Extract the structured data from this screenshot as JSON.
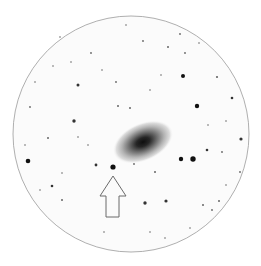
{
  "image": {
    "width": 261,
    "height": 266,
    "background": "#ffffff"
  },
  "field_of_view": {
    "cx": 131,
    "cy": 134,
    "r": 118,
    "fill": "#fbfbfb",
    "stroke": "#9a9a9a"
  },
  "galaxy": {
    "cx": 143,
    "cy": 142,
    "rx": 32,
    "ry": 19,
    "rotation": -24,
    "core_color": "#141414",
    "halo_color": "#bdbdbd"
  },
  "arrow": {
    "tip": [
      113,
      176
    ],
    "head_left": [
      100,
      196
    ],
    "head_right": [
      126,
      196
    ],
    "shaft_left": 106,
    "shaft_right": 119,
    "bottom": 217,
    "stroke": "#6a6a6a"
  },
  "marked_star": {
    "x": 113,
    "y": 167,
    "r": 2.6
  },
  "stars": [
    {
      "x": 28,
      "y": 161,
      "r": 2.3
    },
    {
      "x": 181,
      "y": 159,
      "r": 2.2
    },
    {
      "x": 193,
      "y": 159,
      "r": 2.7
    },
    {
      "x": 183,
      "y": 76,
      "r": 2.0
    },
    {
      "x": 197,
      "y": 106,
      "r": 2.2
    },
    {
      "x": 74,
      "y": 121,
      "r": 1.7
    },
    {
      "x": 78,
      "y": 85,
      "r": 1.5
    },
    {
      "x": 145,
      "y": 203,
      "r": 1.7
    },
    {
      "x": 166,
      "y": 201,
      "r": 1.6
    },
    {
      "x": 241,
      "y": 139,
      "r": 1.6
    },
    {
      "x": 232,
      "y": 98,
      "r": 1.3
    },
    {
      "x": 217,
      "y": 77,
      "r": 1.1
    },
    {
      "x": 96,
      "y": 165,
      "r": 1.4
    },
    {
      "x": 52,
      "y": 186,
      "r": 1.3
    },
    {
      "x": 207,
      "y": 150,
      "r": 1.3
    },
    {
      "x": 48,
      "y": 138,
      "r": 1.0
    },
    {
      "x": 118,
      "y": 106,
      "r": 1.0
    },
    {
      "x": 130,
      "y": 108,
      "r": 1.0
    },
    {
      "x": 91,
      "y": 53,
      "r": 0.9
    },
    {
      "x": 116,
      "y": 82,
      "r": 0.9
    },
    {
      "x": 168,
      "y": 47,
      "r": 1.0
    },
    {
      "x": 180,
      "y": 34,
      "r": 0.9
    },
    {
      "x": 143,
      "y": 41,
      "r": 0.9
    },
    {
      "x": 185,
      "y": 53,
      "r": 0.9
    },
    {
      "x": 203,
      "y": 205,
      "r": 1.0
    },
    {
      "x": 219,
      "y": 201,
      "r": 1.0
    },
    {
      "x": 212,
      "y": 210,
      "r": 0.9
    },
    {
      "x": 240,
      "y": 172,
      "r": 0.9
    },
    {
      "x": 222,
      "y": 152,
      "r": 0.9
    },
    {
      "x": 62,
      "y": 200,
      "r": 1.0
    },
    {
      "x": 30,
      "y": 107,
      "r": 0.9
    },
    {
      "x": 25,
      "y": 145,
      "r": 0.8
    },
    {
      "x": 60,
      "y": 37,
      "r": 0.8
    },
    {
      "x": 71,
      "y": 62,
      "r": 0.8
    },
    {
      "x": 53,
      "y": 66,
      "r": 0.8
    },
    {
      "x": 35,
      "y": 82,
      "r": 0.8
    },
    {
      "x": 155,
      "y": 172,
      "r": 1.0
    },
    {
      "x": 134,
      "y": 164,
      "r": 0.9
    },
    {
      "x": 88,
      "y": 145,
      "r": 0.8
    },
    {
      "x": 62,
      "y": 173,
      "r": 0.8
    },
    {
      "x": 40,
      "y": 190,
      "r": 0.8
    },
    {
      "x": 165,
      "y": 238,
      "r": 0.8
    },
    {
      "x": 104,
      "y": 232,
      "r": 0.8
    },
    {
      "x": 150,
      "y": 232,
      "r": 0.8
    },
    {
      "x": 226,
      "y": 185,
      "r": 0.8
    },
    {
      "x": 208,
      "y": 125,
      "r": 0.8
    },
    {
      "x": 150,
      "y": 90,
      "r": 0.8
    },
    {
      "x": 161,
      "y": 75,
      "r": 0.8
    },
    {
      "x": 102,
      "y": 70,
      "r": 0.8
    },
    {
      "x": 78,
      "y": 137,
      "r": 0.8
    },
    {
      "x": 190,
      "y": 228,
      "r": 0.8
    },
    {
      "x": 126,
      "y": 25,
      "r": 0.8
    },
    {
      "x": 199,
      "y": 43,
      "r": 0.8
    },
    {
      "x": 226,
      "y": 121,
      "r": 0.8
    }
  ]
}
